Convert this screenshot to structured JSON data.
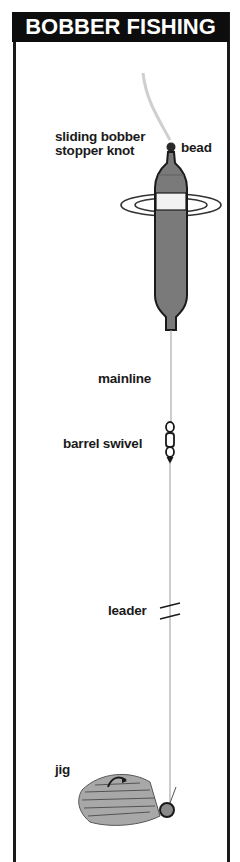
{
  "title": "BOBBER FISHING",
  "labels": {
    "stopper_knot_line1": "sliding bobber",
    "stopper_knot_line2": "stopper knot",
    "bead": "bead",
    "mainline": "mainline",
    "barrel_swivel": "barrel swivel",
    "leader": "leader",
    "jig": "jig"
  },
  "colors": {
    "title_bg": "#0d0d0d",
    "title_text": "#ffffff",
    "border": "#1a1a1a",
    "bobber_body": "#7a7a7a",
    "bobber_band": "#f2f2f2",
    "line": "#9a9a9a"
  }
}
